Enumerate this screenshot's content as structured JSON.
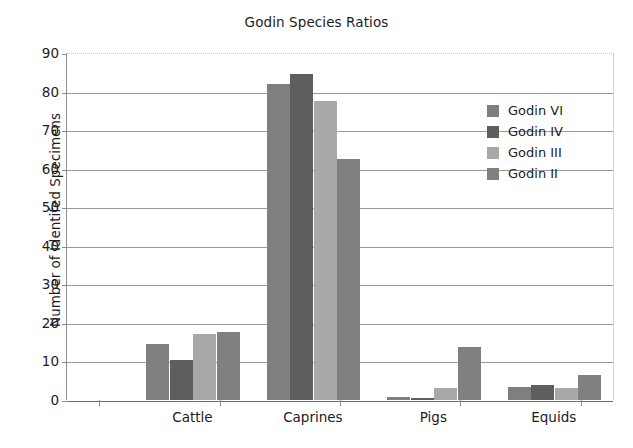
{
  "chart_data": {
    "type": "bar",
    "title": "Godin Species Ratios",
    "xlabel": "",
    "ylabel": "Number of Identifed Specimens",
    "categories": [
      "Cattle",
      "Caprines",
      "Pigs",
      "Equids"
    ],
    "ylim": [
      0,
      90
    ],
    "yticks": [
      0,
      10,
      20,
      30,
      40,
      50,
      60,
      70,
      80,
      90
    ],
    "grid": true,
    "legend_position": "right",
    "series": [
      {
        "name": "Godin VI",
        "color": "#7f7f7f",
        "values": [
          14.5,
          82.0,
          0.8,
          3.3
        ]
      },
      {
        "name": "Godin IV",
        "color": "#5e5e5e",
        "values": [
          10.5,
          84.5,
          0.4,
          4.0
        ]
      },
      {
        "name": "Godin III",
        "color": "#a8a8a8",
        "values": [
          17.2,
          77.5,
          3.0,
          3.0
        ]
      },
      {
        "name": "Godin II",
        "color": "#808080",
        "values": [
          17.7,
          62.5,
          13.7,
          6.5
        ]
      }
    ]
  },
  "axis": {
    "ytick_labels": [
      "0",
      "10",
      "20",
      "30",
      "40",
      "50",
      "60",
      "70",
      "80",
      "90"
    ]
  },
  "legend": {
    "entries": [
      {
        "label": "Godin VI"
      },
      {
        "label": "Godin IV"
      },
      {
        "label": "Godin III"
      },
      {
        "label": "Godin II"
      }
    ]
  }
}
